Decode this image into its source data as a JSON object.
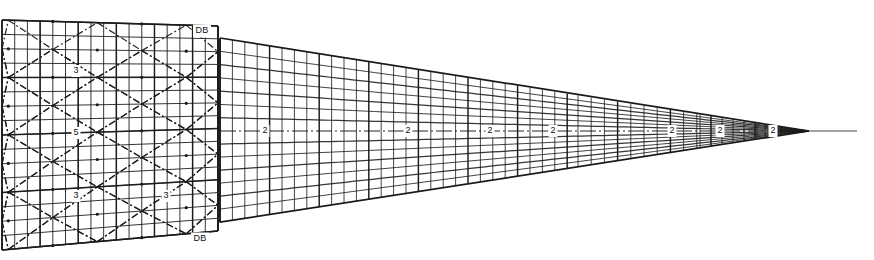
{
  "figure": {
    "type": "technical-mesh-drawing",
    "background_color": "#ffffff",
    "line_color": "#1a1a1a",
    "width": 874,
    "height": 260
  },
  "left_panel": {
    "name": "braced-grid-panel",
    "x_start": 2,
    "x_end": 218,
    "top_left_y": 20,
    "top_right_y": 26,
    "bottom_left_y": 250,
    "bottom_right_y": 231,
    "columns": 17,
    "rows": 16,
    "annotations": [
      {
        "text": "3",
        "x": 76,
        "y": 71
      },
      {
        "text": "5",
        "x": 76,
        "y": 133
      },
      {
        "text": "3",
        "x": 76,
        "y": 196
      },
      {
        "text": "3",
        "x": 166,
        "y": 196
      }
    ],
    "corner_labels": [
      {
        "text": "DB",
        "x": 202,
        "y": 31,
        "position": "top-right"
      },
      {
        "text": "DB",
        "x": 200,
        "y": 239,
        "position": "bottom-right"
      }
    ]
  },
  "wedge_panel": {
    "name": "tapering-wedge-mesh",
    "x_start": 220,
    "tip_x": 809,
    "tail_x": 857,
    "centerline_y": 131,
    "half_height_start": 93,
    "annotations": [
      {
        "text": "2",
        "x": 265,
        "y": 131
      },
      {
        "text": "2",
        "x": 408,
        "y": 131
      },
      {
        "text": "2",
        "x": 490,
        "y": 131
      },
      {
        "text": "2",
        "x": 553,
        "y": 131
      },
      {
        "text": "2",
        "x": 672,
        "y": 131
      },
      {
        "text": "2",
        "x": 720,
        "y": 131
      },
      {
        "text": "2",
        "x": 773,
        "y": 131
      }
    ],
    "refinement_steps": [
      {
        "x": 220,
        "spacing": 12.4
      },
      {
        "x": 578,
        "spacing": 13.2
      },
      {
        "x": 700,
        "spacing": 11.0
      },
      {
        "x": 757,
        "spacing": 8.0
      },
      {
        "x": 790,
        "spacing": 6.0
      }
    ]
  }
}
